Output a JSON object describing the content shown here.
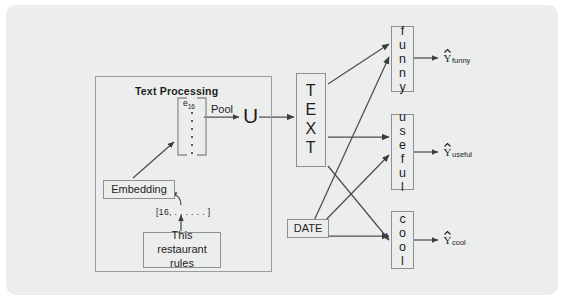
{
  "figure": {
    "type": "neural-network-architecture-diagram",
    "background_color": "#eceded",
    "page_color": "#ffffff",
    "line_color": "#6f7173"
  },
  "group": {
    "title": "Text Processing"
  },
  "nodes": {
    "input_text": "This restaurant rules",
    "token_ids": "[16, . . . . . . ]",
    "embedding": "Embedding",
    "embedding_vector_label": "e",
    "embedding_vector_sub": "16",
    "pool": "Pool",
    "pooled": "U",
    "text_branch": "TEXT",
    "date_branch": "DATE",
    "head_funny": "funny",
    "head_useful": "useful",
    "head_cool": "cool"
  },
  "outputs": {
    "funny": {
      "symbol": "Y",
      "hat": "^",
      "subscript": "funny"
    },
    "useful": {
      "symbol": "Y",
      "hat": "^",
      "subscript": "useful"
    },
    "cool": {
      "symbol": "Y",
      "hat": "^",
      "subscript": "cool"
    }
  },
  "edges": [
    {
      "from": "This restaurant rules",
      "to": "[16, . . . . . . ]"
    },
    {
      "from": "[16, . . . . . . ]",
      "to": "Embedding"
    },
    {
      "from": "Embedding",
      "to": "e16 vector"
    },
    {
      "from": "e16 vector",
      "to": "U",
      "label": "Pool"
    },
    {
      "from": "U",
      "to": "TEXT"
    },
    {
      "from": "TEXT",
      "to": "funny"
    },
    {
      "from": "TEXT",
      "to": "useful"
    },
    {
      "from": "TEXT",
      "to": "cool"
    },
    {
      "from": "DATE",
      "to": "funny"
    },
    {
      "from": "DATE",
      "to": "useful"
    },
    {
      "from": "DATE",
      "to": "cool"
    },
    {
      "from": "funny",
      "to": "Y_funny"
    },
    {
      "from": "useful",
      "to": "Y_useful"
    },
    {
      "from": "cool",
      "to": "Y_cool"
    }
  ]
}
